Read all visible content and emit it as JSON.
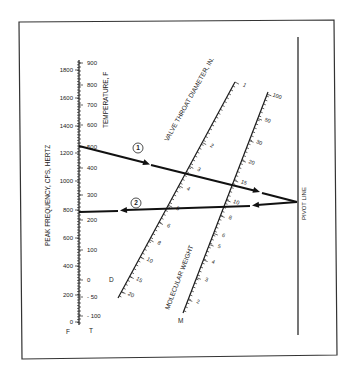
{
  "diagram": {
    "type": "nomograph",
    "frame": {
      "points": [
        [
          19,
          22
        ],
        [
          334,
          20
        ],
        [
          337,
          355
        ],
        [
          22,
          359
        ]
      ]
    },
    "scales": {
      "frequency": {
        "title": "PEAK FREQUENCY, CPS, HERTZ",
        "letter": "F",
        "x": 79,
        "y_top": 60,
        "y_bottom": 325,
        "labels": [
          {
            "v": "1800",
            "y": 70
          },
          {
            "v": "1600",
            "y": 98
          },
          {
            "v": "1400",
            "y": 126
          },
          {
            "v": "1200",
            "y": 153
          },
          {
            "v": "1000",
            "y": 181
          },
          {
            "v": "800",
            "y": 210
          },
          {
            "v": "600",
            "y": 238
          },
          {
            "v": "400",
            "y": 266
          },
          {
            "v": "200",
            "y": 295
          },
          {
            "v": "0",
            "y": 322
          }
        ]
      },
      "temperature": {
        "title": "TEMPERATURE, F",
        "letter": "T",
        "labels": [
          {
            "v": "900",
            "y": 63
          },
          {
            "v": "800",
            "y": 85
          },
          {
            "v": "700",
            "y": 105
          },
          {
            "v": "600",
            "y": 125
          },
          {
            "v": "500",
            "y": 147
          },
          {
            "v": "400",
            "y": 168
          },
          {
            "v": "300",
            "y": 195
          },
          {
            "v": "200",
            "y": 220
          },
          {
            "v": "100",
            "y": 250
          },
          {
            "v": "0",
            "y": 280
          },
          {
            "v": "- 50",
            "y": 297
          },
          {
            "v": "- 100",
            "y": 316
          }
        ]
      },
      "diameter": {
        "title": "VALVE THROAT DIAMETER, IN.",
        "letter": "D",
        "start": [
          118,
          298
        ],
        "end": [
          235,
          82
        ],
        "labels": [
          {
            "v": "20",
            "t": 0.03
          },
          {
            "v": "15",
            "t": 0.1
          },
          {
            "v": "10",
            "t": 0.19
          },
          {
            "v": "8",
            "t": 0.27
          },
          {
            "v": "6",
            "t": 0.35
          },
          {
            "v": "5",
            "t": 0.43
          },
          {
            "v": "4",
            "t": 0.52
          },
          {
            "v": "3",
            "t": 0.61
          },
          {
            "v": "2",
            "t": 0.72
          },
          {
            "v": "1",
            "t": 1.0
          }
        ]
      },
      "molecular_weight": {
        "title": "MOLECULAR WEIGHT",
        "letter": "M",
        "start": [
          183,
          313
        ],
        "end": [
          268,
          92
        ],
        "labels": [
          {
            "v": "2",
            "t": 0.06
          },
          {
            "v": "3",
            "t": 0.16
          },
          {
            "v": "4",
            "t": 0.24
          },
          {
            "v": "5",
            "t": 0.31
          },
          {
            "v": "6",
            "t": 0.36
          },
          {
            "v": "8",
            "t": 0.44
          },
          {
            "v": "10",
            "t": 0.51
          },
          {
            "v": "15",
            "t": 0.6
          },
          {
            "v": "20",
            "t": 0.69
          },
          {
            "v": "30",
            "t": 0.78
          },
          {
            "v": "50",
            "t": 0.88
          },
          {
            "v": "100",
            "t": 0.99
          }
        ]
      },
      "pivot": {
        "title": "PIVOT LINE",
        "x": 298,
        "y_top": 37,
        "y_bottom": 335
      }
    },
    "paths": [
      {
        "label": "1",
        "label_pos": [
          138,
          148
        ],
        "segments": [
          [
            [
              79,
              146
            ],
            [
              146,
              163
            ]
          ],
          [
            [
              151,
              165
            ],
            [
              256,
              191
            ]
          ],
          [
            [
              262,
              193
            ],
            [
              297,
              202
            ]
          ]
        ],
        "arrows": [
          [
            [
              140,
              161
            ],
            [
              150,
              164.5
            ]
          ],
          [
            [
              250,
              189
            ],
            [
              260,
              192
            ]
          ]
        ]
      },
      {
        "label": "2",
        "label_pos": [
          136,
          203
        ],
        "segments": [
          [
            [
              297,
              202
            ],
            [
              257,
              205
            ]
          ],
          [
            [
              250,
              206
            ],
            [
              126,
              210
            ]
          ],
          [
            [
              118,
              211
            ],
            [
              79,
              212
            ]
          ]
        ],
        "arrows": [
          [
            [
              262,
              204.5
            ],
            [
              252,
              205.5
            ]
          ],
          [
            [
              130,
              209.7
            ],
            [
              120,
              210.5
            ]
          ]
        ]
      }
    ]
  }
}
